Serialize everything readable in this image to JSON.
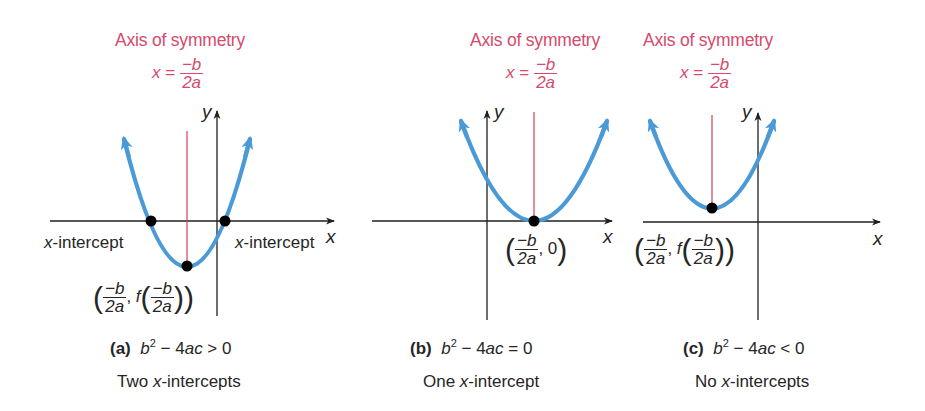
{
  "figure": {
    "colors": {
      "curve": "#4a9ad8",
      "axis_of_symmetry_line": "#d0405a",
      "axis_label_text": "#d64a6c",
      "axes": "#1f1f1f",
      "points": "#000000",
      "text": "#262626"
    },
    "panels": [
      {
        "id": "a",
        "axis_of_symmetry": {
          "title": "Axis of symmetry",
          "lhs": "x",
          "eq": "=",
          "num": "−b",
          "den": "2a"
        },
        "axis_labels": {
          "x": "x",
          "y": "y"
        },
        "intercept_label_left": "x-intercept",
        "intercept_label_right": "x-intercept",
        "vertex_label": {
          "num": "−b",
          "den": "2a",
          "sep": ",",
          "func": "f"
        },
        "caption": {
          "tag": "(a)",
          "expr_b": "b",
          "expr_exp": "2",
          "expr_rest": " − 4",
          "expr_ac": "ac",
          "expr_rel": " > 0",
          "description_pre": "Two ",
          "description_x": "x",
          "description_post": "-intercepts"
        }
      },
      {
        "id": "b",
        "axis_of_symmetry": {
          "title": "Axis of symmetry",
          "lhs": "x",
          "eq": "=",
          "num": "−b",
          "den": "2a"
        },
        "axis_labels": {
          "x": "x",
          "y": "y"
        },
        "vertex_label": {
          "num": "−b",
          "den": "2a",
          "sep": ",",
          "value": "0"
        },
        "caption": {
          "tag": "(b)",
          "expr_b": "b",
          "expr_exp": "2",
          "expr_rest": " − 4",
          "expr_ac": "ac",
          "expr_rel": " = 0",
          "description_pre": "One ",
          "description_x": "x",
          "description_post": "-intercept"
        }
      },
      {
        "id": "c",
        "axis_of_symmetry": {
          "title": "Axis of symmetry",
          "lhs": "x",
          "eq": "=",
          "num": "−b",
          "den": "2a"
        },
        "axis_labels": {
          "x": "x",
          "y": "y"
        },
        "vertex_label": {
          "num": "−b",
          "den": "2a",
          "sep": ",",
          "func": "f"
        },
        "caption": {
          "tag": "(c)",
          "expr_b": "b",
          "expr_exp": "2",
          "expr_rest": " − 4",
          "expr_ac": "ac",
          "expr_rel": " < 0",
          "description_pre": "No ",
          "description_x": "x",
          "description_post": "-intercepts"
        }
      }
    ]
  }
}
